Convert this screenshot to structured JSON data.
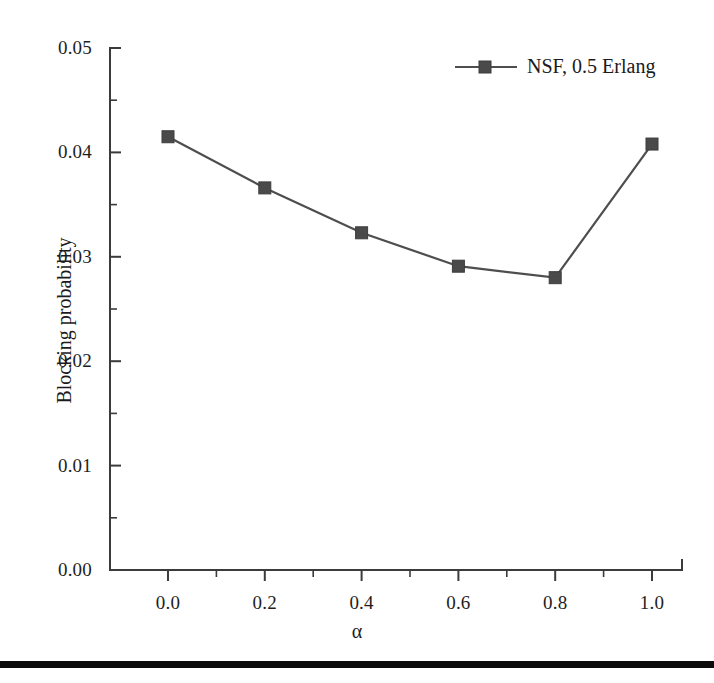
{
  "figure": {
    "background_color": "#ffffff",
    "line_color": "#4e4e4e",
    "marker_color": "#4a4a4a",
    "axis_color": "#3b3b3b"
  },
  "axes": {
    "ylabel": "Blocking probability",
    "xlabel": "α",
    "ytick_labels": [
      "0.05",
      "0.04",
      "0.03",
      "0.02",
      "0.01",
      "0.00"
    ],
    "xtick_labels": [
      "0.0",
      "0.2",
      "0.4",
      "0.6",
      "0.8",
      "1.0"
    ]
  },
  "legend": {
    "entries": [
      {
        "label": "NSF, 0.5 Erlang",
        "marker": "square",
        "color": "#4a4a4a"
      }
    ]
  },
  "page": {
    "bottom_rule_color": "#0b0b0b"
  },
  "chart_data": {
    "type": "line",
    "title": "",
    "xlabel": "α",
    "ylabel": "Blocking probability",
    "xlim": [
      -0.06,
      1.1
    ],
    "ylim": [
      0.0,
      0.05
    ],
    "xticks": [
      0.0,
      0.2,
      0.4,
      0.6,
      0.8,
      1.0
    ],
    "yticks": [
      0.0,
      0.01,
      0.02,
      0.03,
      0.04,
      0.05
    ],
    "xminor_step": 0.1,
    "yminor_step": 0.005,
    "grid": false,
    "legend_position": "top-right",
    "x": [
      0.0,
      0.2,
      0.4,
      0.6,
      0.8,
      1.0
    ],
    "series": [
      {
        "name": "NSF, 0.5 Erlang",
        "marker": "square",
        "color": "#4a4a4a",
        "values": [
          0.0415,
          0.0366,
          0.0323,
          0.0291,
          0.028,
          0.0408
        ]
      }
    ]
  }
}
